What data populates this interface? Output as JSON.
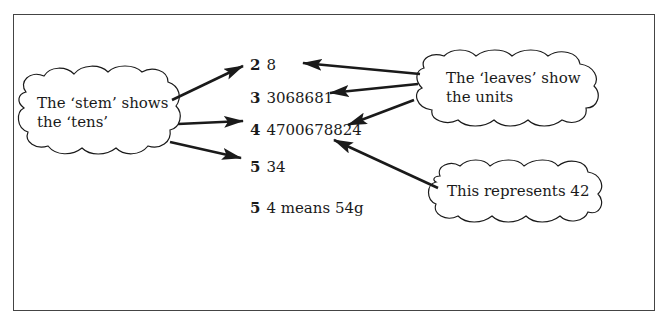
{
  "diagram": {
    "type": "stem-and-leaf annotated diagram",
    "rows": [
      {
        "stem": "2",
        "leaves": "8"
      },
      {
        "stem": "3",
        "leaves": "3068681"
      },
      {
        "stem": "4",
        "leaves": "4700678824"
      },
      {
        "stem": "5",
        "leaves": "34"
      }
    ],
    "key": {
      "stem": "5",
      "leaves": "4 means 54g"
    },
    "callouts": {
      "stem": {
        "line1": "The ‘stem’ shows",
        "line2": "the ‘tens’"
      },
      "leaves": {
        "line1": "The ‘leaves’ show",
        "line2": "the units"
      },
      "example": {
        "line1": "This represents 42"
      }
    },
    "colors": {
      "line": "#1a1a1a",
      "frame": "#444444",
      "background": "#ffffff"
    }
  }
}
